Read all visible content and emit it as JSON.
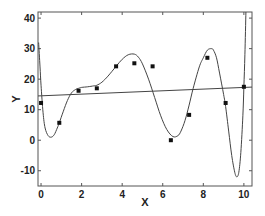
{
  "chart_data": {
    "type": "scatter",
    "title": "",
    "xlabel": "X",
    "ylabel": "Y",
    "xlim": [
      -0.15,
      10.4
    ],
    "ylim": [
      -15,
      42
    ],
    "grid": false,
    "legend": null,
    "x_ticks": [
      0,
      2,
      4,
      6,
      8,
      10
    ],
    "y_ticks": [
      -10,
      0,
      10,
      20,
      30,
      40
    ],
    "series": [
      {
        "name": "data points",
        "type": "scatter",
        "marker": "filled-square",
        "x": [
          0,
          0.9,
          1.85,
          2.75,
          3.7,
          4.6,
          5.5,
          6.4,
          7.3,
          8.2,
          9.1,
          10.0
        ],
        "y": [
          12.2,
          5.7,
          16.2,
          17.0,
          24.2,
          25.2,
          24.2,
          0.0,
          8.3,
          27.0,
          12.2,
          17.5
        ]
      },
      {
        "name": "linear fit",
        "type": "line",
        "x": [
          -0.15,
          10.4
        ],
        "y": [
          14.5,
          17.4
        ]
      },
      {
        "name": "high-order polynomial fit",
        "type": "line",
        "x": [
          -0.12,
          -0.05,
          0.0,
          0.1,
          0.2,
          0.35,
          0.5,
          0.65,
          0.8,
          0.9,
          1.1,
          1.3,
          1.5,
          1.7,
          1.85,
          2.0,
          2.3,
          2.6,
          2.75,
          3.0,
          3.3,
          3.7,
          4.0,
          4.3,
          4.6,
          4.8,
          5.0,
          5.3,
          5.6,
          5.9,
          6.2,
          6.5,
          6.75,
          6.9,
          7.1,
          7.3,
          7.5,
          7.8,
          8.0,
          8.2,
          8.4,
          8.5,
          8.65,
          8.8,
          9.0,
          9.1,
          9.25,
          9.4,
          9.55,
          9.65,
          9.75,
          9.85,
          9.95,
          10.0,
          10.05,
          10.1
        ],
        "y": [
          32,
          24,
          18,
          9,
          4,
          1.5,
          1.0,
          1.8,
          4.0,
          5.7,
          9.5,
          13.0,
          15.5,
          16.6,
          17.0,
          17.3,
          17.5,
          17.8,
          18.0,
          19.0,
          21.0,
          24.2,
          26.5,
          28.0,
          28.2,
          27.2,
          25.0,
          20.0,
          14.0,
          8.0,
          3.5,
          1.2,
          1.5,
          3.0,
          6.5,
          11.5,
          17.0,
          24.0,
          27.0,
          29.5,
          30.0,
          29.5,
          27.0,
          22.0,
          15.0,
          11.0,
          3.0,
          -5.0,
          -10.5,
          -12.0,
          -10.5,
          -4.0,
          8.0,
          17.5,
          28.0,
          42.0
        ]
      }
    ]
  },
  "plot": {
    "x_axis_label": "X",
    "y_axis_label": "Y",
    "x_tick_labels": [
      "0",
      "2",
      "4",
      "6",
      "8",
      "10"
    ],
    "y_tick_labels": [
      "-10",
      "0",
      "10",
      "20",
      "30",
      "40"
    ]
  },
  "colors": {
    "background": "#ffffff",
    "frame": "#555555",
    "curve": "#444444",
    "fit_line": "#444444",
    "marker": "#111111",
    "text": "#222222"
  }
}
